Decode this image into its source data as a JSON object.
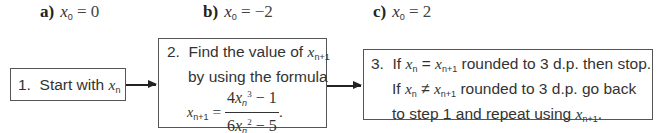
{
  "parts": [
    {
      "label": "a)",
      "var": "x",
      "sub": "0",
      "eq": " = 0"
    },
    {
      "label": "b)",
      "var": "x",
      "sub": "0",
      "eq": " = −2"
    },
    {
      "label": "c)",
      "var": "x",
      "sub": "0",
      "eq": " = 2"
    }
  ],
  "steps": {
    "step1": {
      "num": "1.",
      "text": "Start with ",
      "var": "x",
      "sub": "n"
    },
    "step2": {
      "num": "2.",
      "line1": "Find the value of ",
      "line1_var": "x",
      "line1_sub": "n+1",
      "line2": "by using the formula",
      "formula": {
        "lhs_var": "x",
        "lhs_sub": "n+1",
        "eq": " = ",
        "num_coef": "4",
        "num_var": "x",
        "num_sub": "n",
        "num_pow": "3",
        "num_rest": " − 1",
        "den_coef": "6",
        "den_var": "x",
        "den_sub": "n",
        "den_pow": "2",
        "den_rest": " − 5",
        "end": "."
      }
    },
    "step3": {
      "num": "3.",
      "l1_a": "If ",
      "l1_var1": "x",
      "l1_sub1": "n",
      "l1_eq": " = ",
      "l1_var2": "x",
      "l1_sub2": "n+1",
      "l1_b": " rounded to 3 d.p. then stop.",
      "l2_a": "If ",
      "l2_var1": "x",
      "l2_sub1": "n",
      "l2_ne": " ≠ ",
      "l2_var2": "x",
      "l2_sub2": "n+1",
      "l2_b": " rounded to 3 d.p. go back",
      "l3_a": "to step 1 and repeat using ",
      "l3_var": "x",
      "l3_sub": "n+1",
      "l3_end": "."
    }
  }
}
